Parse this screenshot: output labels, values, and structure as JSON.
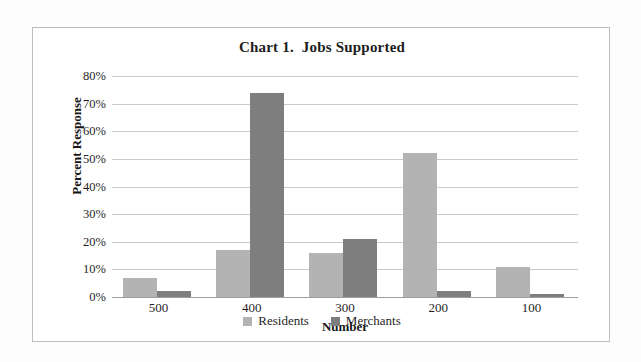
{
  "chart_data": {
    "type": "bar",
    "title": "Chart 1.  Jobs Supported",
    "xlabel": "Number",
    "ylabel": "Percent Response",
    "categories": [
      "500",
      "400",
      "300",
      "200",
      "100"
    ],
    "series": [
      {
        "name": "Residents",
        "color": "#b3b3b3",
        "values": [
          7,
          17,
          16,
          52,
          11
        ]
      },
      {
        "name": "Merchants",
        "color": "#7e7e7e",
        "values": [
          2,
          74,
          21,
          2,
          1
        ]
      }
    ],
    "ylim": [
      0,
      80
    ],
    "yticks": [
      "0%",
      "10%",
      "20%",
      "30%",
      "40%",
      "50%",
      "60%",
      "70%",
      "80%"
    ],
    "ytick_values": [
      0,
      10,
      20,
      30,
      40,
      50,
      60,
      70,
      80
    ],
    "grid": true,
    "legend_position": "bottom",
    "value_unit": "percent"
  },
  "frame": {
    "border_color": "#bdbdbd",
    "background": "#ffffff"
  }
}
